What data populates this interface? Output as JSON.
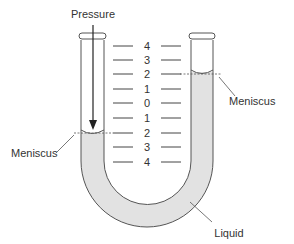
{
  "diagram": {
    "labels": {
      "pressure": "Pressure",
      "meniscus_left": "Meniscus",
      "meniscus_right": "Meniscus",
      "liquid": "Liquid"
    },
    "scale": {
      "ticks": [
        "4",
        "3",
        "2",
        "1",
        "0",
        "1",
        "2",
        "3",
        "4"
      ]
    },
    "readings": {
      "left_meniscus_level": "2 (below zero)",
      "right_meniscus_level": "2 (above zero)"
    },
    "colors": {
      "liquid": "#e2e2e2",
      "outline": "#555555",
      "text": "#333333",
      "background": "#ffffff"
    }
  }
}
